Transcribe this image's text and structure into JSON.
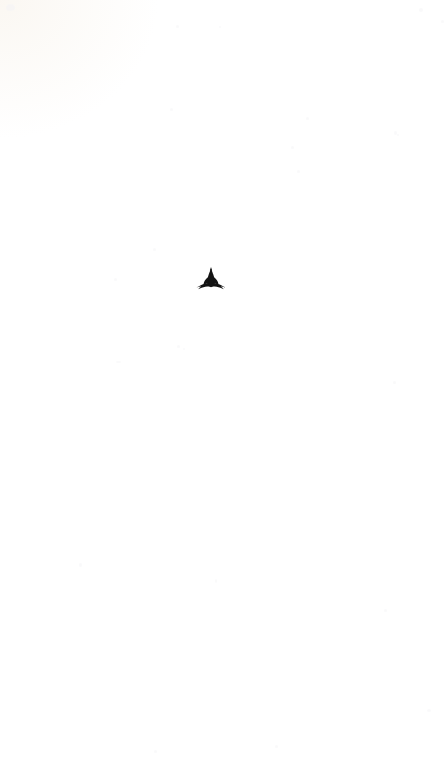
{
  "document": {
    "type": "scanned-book-page",
    "page_state": "blank",
    "body_text": "",
    "paper_color": "#ffffff",
    "ink_color": "#1a1a1a",
    "page_width": 447,
    "page_height": 760
  },
  "ornament": {
    "name": "fleuron-ornament",
    "description": "Typographic leaf ornament (fleuron) centered on an otherwise blank page",
    "glyph": "fleuron-leaf",
    "color": "#141414",
    "center_x": 211,
    "center_y": 279,
    "width": 32,
    "height": 23
  },
  "artifacts": {
    "corner_tint_label": "scanner corner tint",
    "speckle_label": "scan speckle"
  }
}
